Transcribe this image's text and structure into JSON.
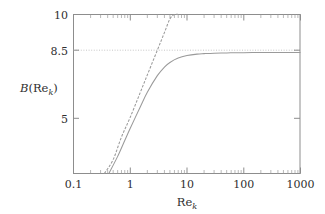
{
  "chart_data": {
    "type": "line",
    "title": "",
    "subtitle": "",
    "xlabel": "Re_k",
    "xlabel_base": "Re",
    "xlabel_sub": "k",
    "ylabel": "B(Re_k)",
    "ylabel_italic": "B",
    "ylabel_open": "(Re",
    "ylabel_sub": "k",
    "ylabel_close": ")",
    "xscale": "log",
    "yscale": "linear",
    "xlim": [
      0.1,
      1000
    ],
    "ylim": [
      3.5,
      10
    ],
    "grid": false,
    "legend": "none",
    "xticks": [
      0.1,
      1,
      10,
      100,
      1000
    ],
    "xticklabels": [
      "0.1",
      "1",
      "10",
      "100",
      "1000"
    ],
    "yticks": [
      5,
      8.5,
      10
    ],
    "yticklabels": [
      "5",
      "8.5",
      "10"
    ],
    "minor_ticks": "log-decade",
    "annotations": [
      {
        "name": "asymptote-line",
        "type": "horizontal-line",
        "value": 8.5,
        "style": "dotted",
        "label": "8.5"
      }
    ],
    "series": [
      {
        "name": "log-law-asymptote",
        "style": "dashed",
        "color": "#9a9a9a",
        "description": "straight log-linear line, B = 5.75 log10(Re_k) + 5.8",
        "x": [
          0.35,
          0.5,
          0.7,
          1.0,
          1.5,
          2.0,
          3.0,
          4.0,
          5.0,
          6.0,
          7.0
        ],
        "y": [
          3.5,
          4.07,
          4.99,
          5.8,
          6.81,
          7.53,
          8.54,
          9.26,
          9.82,
          10.0,
          10.0
        ]
      },
      {
        "name": "b-function-curve",
        "style": "solid",
        "color": "#9a9a9a",
        "description": "B(Re_k) rising then saturating near 8.45",
        "x": [
          0.42,
          0.6,
          0.8,
          1.0,
          1.5,
          2.0,
          3.0,
          4.0,
          5.0,
          7.0,
          10.0,
          15.0,
          20.0,
          30.0,
          50.0,
          70.0,
          100.0,
          200.0,
          300.0,
          500.0,
          1000.0
        ],
        "y": [
          3.5,
          4.2,
          4.85,
          5.35,
          6.22,
          6.82,
          7.5,
          7.85,
          8.04,
          8.22,
          8.32,
          8.38,
          8.4,
          8.42,
          8.43,
          8.44,
          8.44,
          8.45,
          8.45,
          8.45,
          8.45
        ]
      }
    ],
    "colors": {
      "axis": "#8d8d8d",
      "grid": "#b9b9b9",
      "curve": "#9a9a9a",
      "text": "#2f2f2f",
      "background": "#ffffff"
    }
  }
}
